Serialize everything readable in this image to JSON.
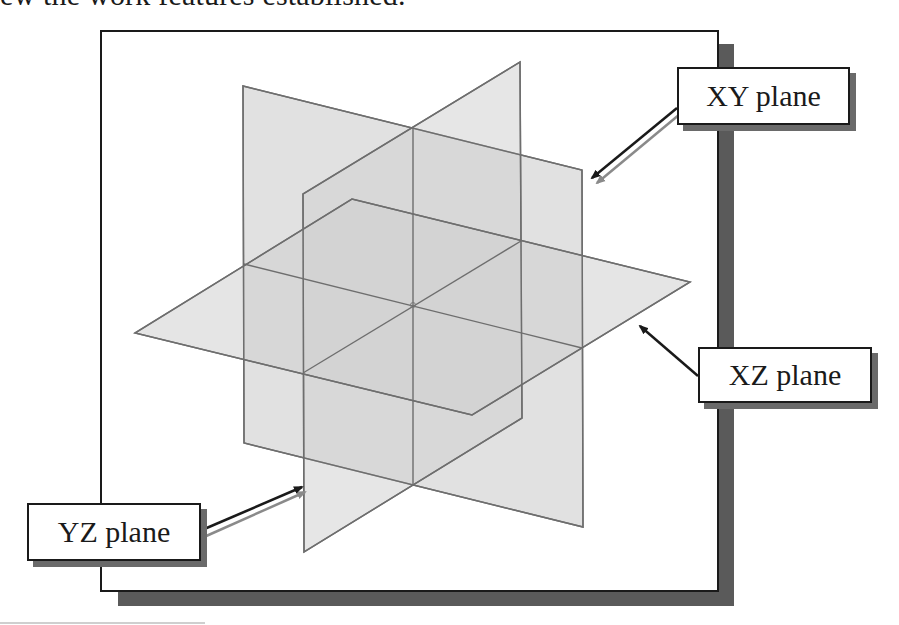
{
  "caption": {
    "text": "ew the work features established."
  },
  "diagram": {
    "frame": {
      "border_color": "#1a1a1a",
      "shadow_color": "#5a5a5a",
      "background": "#ffffff"
    },
    "planes": [
      {
        "name": "XY plane",
        "fill": "#d9d9d9",
        "edge": "#6e6e6e"
      },
      {
        "name": "YZ plane",
        "fill": "#d4d4d4",
        "edge": "#6e6e6e"
      },
      {
        "name": "XZ plane",
        "fill": "#d0d0d0",
        "edge": "#6e6e6e"
      }
    ],
    "callouts": [
      {
        "id": "xy",
        "label": "XY plane"
      },
      {
        "id": "xz",
        "label": "XZ plane"
      },
      {
        "id": "yz",
        "label": "YZ plane"
      }
    ]
  }
}
